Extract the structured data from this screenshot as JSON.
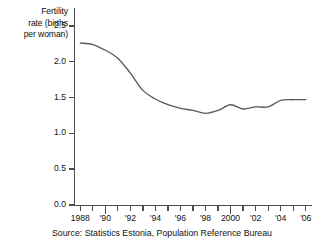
{
  "chart_data": {
    "type": "line",
    "title": "",
    "subtitle": "",
    "xlabel": "",
    "ylabel": "Fertility rate (births per woman)",
    "ylabel_lines": [
      "Fertility",
      "rate (births",
      "per woman)"
    ],
    "xlim": [
      1987.5,
      2006.5
    ],
    "ylim": [
      0.0,
      2.75
    ],
    "grid": false,
    "legend": false,
    "legend_position": "none",
    "line_color": "#595959",
    "axis_color": "#4d4d4d",
    "y_ticks": [
      {
        "value": 2.5,
        "label": "2.5"
      },
      {
        "value": 2.0,
        "label": "2.0"
      },
      {
        "value": 1.5,
        "label": "1.5"
      },
      {
        "value": 1.0,
        "label": "1.0"
      },
      {
        "value": 0.5,
        "label": "0.5"
      },
      {
        "value": 0.0,
        "label": "0.0"
      }
    ],
    "x_ticks": [
      {
        "value": 1988,
        "label": "1988",
        "major": false
      },
      {
        "value": 1989,
        "label": "",
        "major": false
      },
      {
        "value": 1990,
        "label": "'90",
        "major": true
      },
      {
        "value": 1991,
        "label": "",
        "major": false
      },
      {
        "value": 1992,
        "label": "'92",
        "major": false
      },
      {
        "value": 1993,
        "label": "",
        "major": false
      },
      {
        "value": 1994,
        "label": "'94",
        "major": false
      },
      {
        "value": 1995,
        "label": "",
        "major": false
      },
      {
        "value": 1996,
        "label": "'96",
        "major": false
      },
      {
        "value": 1997,
        "label": "",
        "major": false
      },
      {
        "value": 1998,
        "label": "'98",
        "major": false
      },
      {
        "value": 1999,
        "label": "",
        "major": false
      },
      {
        "value": 2000,
        "label": "2000",
        "major": true
      },
      {
        "value": 2001,
        "label": "",
        "major": false
      },
      {
        "value": 2002,
        "label": "'02",
        "major": false
      },
      {
        "value": 2003,
        "label": "",
        "major": false
      },
      {
        "value": 2004,
        "label": "'04",
        "major": false
      },
      {
        "value": 2005,
        "label": "",
        "major": false
      },
      {
        "value": 2006,
        "label": "'06",
        "major": false
      }
    ],
    "x": [
      1988,
      1989,
      1990,
      1991,
      1992,
      1993,
      1994,
      1995,
      1996,
      1997,
      1998,
      1999,
      2000,
      2001,
      2002,
      2003,
      2004,
      2005,
      2006
    ],
    "values": [
      2.26,
      2.24,
      2.16,
      2.05,
      1.84,
      1.6,
      1.48,
      1.4,
      1.35,
      1.32,
      1.28,
      1.32,
      1.4,
      1.34,
      1.37,
      1.37,
      1.46,
      1.47,
      1.47
    ],
    "series": [
      {
        "name": "Fertility rate",
        "values": [
          2.26,
          2.24,
          2.16,
          2.05,
          1.84,
          1.6,
          1.48,
          1.4,
          1.35,
          1.32,
          1.28,
          1.32,
          1.4,
          1.34,
          1.37,
          1.37,
          1.46,
          1.47,
          1.47
        ]
      }
    ],
    "source": "Source:  Statistics Estonia, Population Reference Bureau"
  },
  "footer": {
    "source": "Source:  Statistics Estonia, Population Reference Bureau"
  }
}
